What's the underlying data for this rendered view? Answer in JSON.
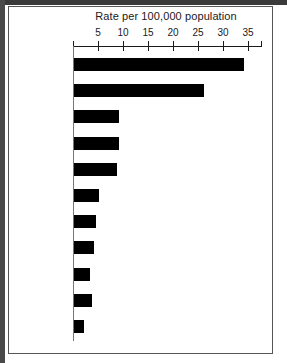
{
  "chart_data": {
    "type": "bar",
    "orientation": "horizontal",
    "title": "Rate per 100,000 population",
    "xlabel": "",
    "ylabel": "",
    "xlim": [
      0,
      37.6
    ],
    "grid": false,
    "legend": null,
    "xticks": [
      5,
      10,
      15,
      20,
      25,
      30,
      35
    ],
    "xtick_labels": [
      "5",
      "10",
      "15",
      "20",
      "25",
      "30",
      "35"
    ],
    "categories": [
      "Hong Kong",
      "Senegal",
      "Japan",
      "Spain",
      "Italy",
      "Sweden",
      "Finland",
      "USA",
      "Norway",
      "Australia",
      "Canada"
    ],
    "values": [
      34,
      26,
      9,
      9,
      8.5,
      5,
      4.3,
      4,
      3.2,
      3.5,
      2
    ],
    "bar_color": "#000000"
  }
}
